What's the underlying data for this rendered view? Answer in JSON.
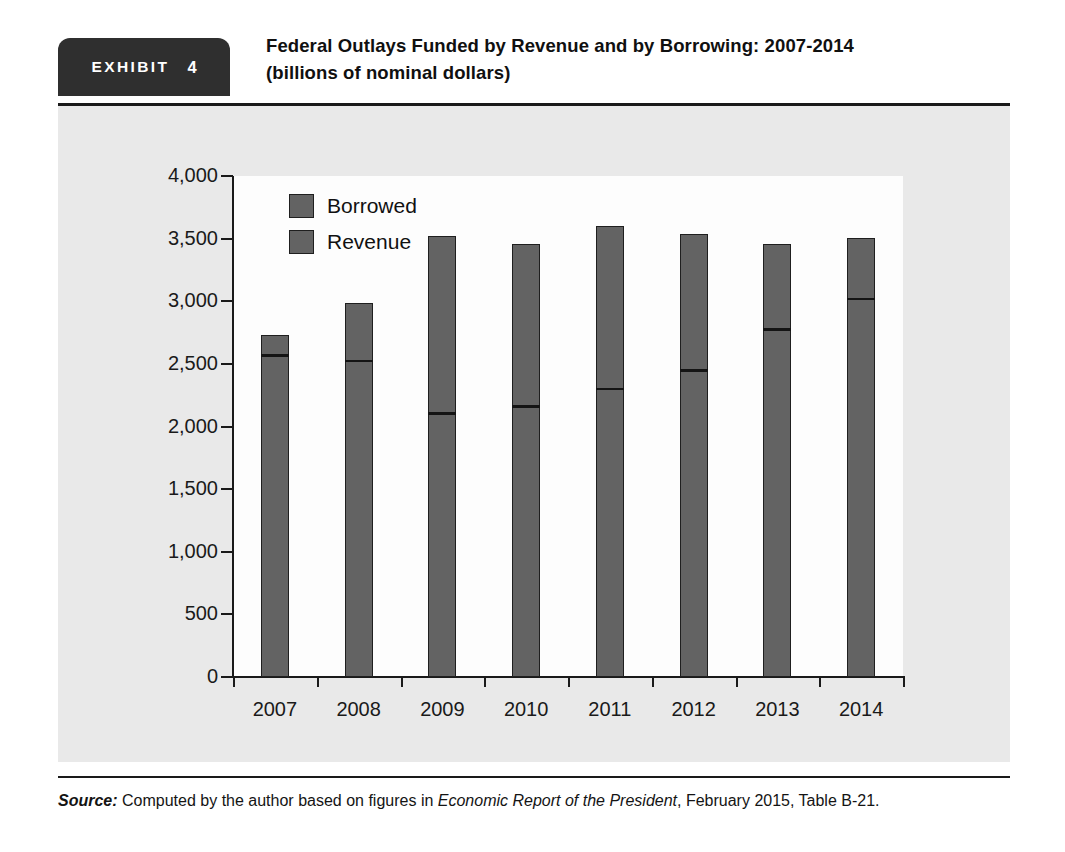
{
  "exhibit": {
    "badge_word": "EXHIBIT",
    "badge_number": "4",
    "title_line1": "Federal Outlays Funded by Revenue and by Borrowing: 2007-2014",
    "title_line2": "(billions of nominal dollars)"
  },
  "source": {
    "label": "Source:",
    "text_before_italic": " Computed by the author based on figures in ",
    "italic_title": "Economic Report of the President",
    "text_after_italic": ", February 2015, Table B-21."
  },
  "colors": {
    "bar_fill": "#636363",
    "bar_outline": "#1f1f1f",
    "panel_background": "#e9e9e9",
    "plot_background": "#fdfdfd",
    "badge_background": "#2f2f2f",
    "axis": "#1a1a1a"
  },
  "chart_data": {
    "type": "bar",
    "subtype": "stacked",
    "title": "Federal Outlays Funded by Revenue and by Borrowing: 2007-2014",
    "subtitle": "(billions of nominal dollars)",
    "xlabel": "",
    "ylabel": "",
    "ylim": [
      0,
      4000
    ],
    "ytick_values": [
      0,
      500,
      1000,
      1500,
      2000,
      2500,
      3000,
      3500,
      4000
    ],
    "ytick_labels": [
      "0",
      "500",
      "1,000",
      "1,500",
      "2,000",
      "2,500",
      "3,000",
      "3,500",
      "4,000"
    ],
    "grid": false,
    "legend_position": "upper-left-inside",
    "legend": [
      "Borrowed",
      "Revenue"
    ],
    "categories": [
      "2007",
      "2008",
      "2009",
      "2010",
      "2011",
      "2012",
      "2013",
      "2014"
    ],
    "series": [
      {
        "name": "Revenue",
        "values": [
          2568,
          2524,
          2105,
          2163,
          2303,
          2450,
          2775,
          3021
        ]
      },
      {
        "name": "Borrowed",
        "values": [
          161,
          459,
          1413,
          1294,
          1297,
          1087,
          680,
          485
        ]
      }
    ],
    "totals": [
      2729,
      2983,
      3518,
      3457,
      3600,
      3537,
      3455,
      3506
    ]
  }
}
